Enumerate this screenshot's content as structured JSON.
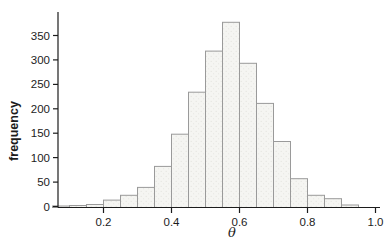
{
  "figure": {
    "background": "#ffffff",
    "bar_fill": "#f5f5f2",
    "bar_texture_dot": "#e4e4df",
    "bar_stroke": "#9a9a9a",
    "axis_color": "#1c1c1c",
    "text_color": "#1c1c1c"
  },
  "chart_data": {
    "type": "bar",
    "subtype": "histogram",
    "title": "",
    "xlabel": "θ",
    "ylabel": "frequency",
    "bin_start": 0.05,
    "bin_width": 0.05,
    "bin_edges": [
      0.05,
      0.1,
      0.15,
      0.2,
      0.25,
      0.3,
      0.35,
      0.4,
      0.45,
      0.5,
      0.55,
      0.6,
      0.65,
      0.7,
      0.75,
      0.8,
      0.85,
      0.9,
      0.95
    ],
    "frequencies": [
      1,
      2,
      4,
      13,
      23,
      39,
      82,
      148,
      234,
      318,
      377,
      293,
      211,
      133,
      57,
      23,
      16,
      3
    ],
    "x_ticks": [
      0.2,
      0.4,
      0.6,
      0.8,
      1.0
    ],
    "x_tick_labels": [
      "0.2",
      "0.4",
      "0.6",
      "0.8",
      "1.0"
    ],
    "y_ticks": [
      0,
      50,
      100,
      150,
      200,
      250,
      300,
      350
    ],
    "y_tick_labels": [
      "0",
      "50",
      "100",
      "150",
      "200",
      "250",
      "300",
      "350"
    ],
    "xlim": [
      0.03,
      1.05
    ],
    "ylim": [
      0,
      385
    ],
    "grid": false,
    "legend": null
  }
}
